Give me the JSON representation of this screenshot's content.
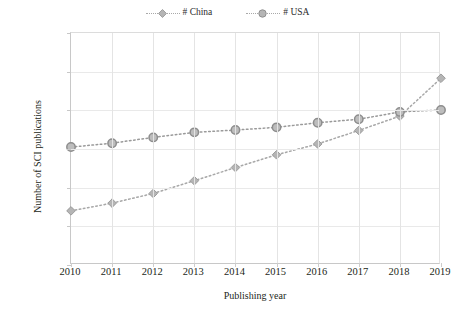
{
  "chart_data": {
    "type": "line",
    "title": "",
    "xlabel": "Publishing year",
    "ylabel": "Number of SCI publications",
    "x": [
      2010,
      2011,
      2012,
      2013,
      2014,
      2015,
      2016,
      2017,
      2018,
      2019
    ],
    "categories": [
      "2010",
      "2011",
      "2012",
      "2013",
      "2014",
      "2015",
      "2016",
      "2017",
      "2018",
      "2019"
    ],
    "xlim": [
      2010,
      2019
    ],
    "ylim": [
      0,
      600000
    ],
    "ytick_labels": [
      "0",
      "100000",
      "200000",
      "300000",
      "400000",
      "500000",
      "600000"
    ],
    "ytick_values": [
      0,
      100000,
      200000,
      300000,
      400000,
      500000,
      600000
    ],
    "grid": true,
    "legend_position": "top-center",
    "series": [
      {
        "name": "# China",
        "marker": "diamond",
        "color": "#a8a8a8",
        "linestyle": "dotted",
        "values": [
          140000,
          160000,
          185000,
          218000,
          252000,
          285000,
          313000,
          348000,
          385000,
          483000
        ]
      },
      {
        "name": "# USA",
        "marker": "circle",
        "color": "#9a9a9a",
        "linestyle": "dotted",
        "values": [
          305000,
          315000,
          330000,
          343000,
          349000,
          356000,
          368000,
          377000,
          396000,
          401000
        ]
      }
    ]
  },
  "legend": {
    "entries": [
      {
        "label": "# China",
        "marker": "diamond-marker-icon"
      },
      {
        "label": "# USA",
        "marker": "circle-marker-icon"
      }
    ]
  },
  "axes": {
    "y_title": "Number of SCI publications",
    "x_title": "Publishing year"
  },
  "colors": {
    "series_gray": "#a8a8a8",
    "marker_fill": "#b5b5b5",
    "marker_stroke": "#8f8f8f",
    "gridline": "#e9e9e9",
    "axis": "#c8c8c8",
    "text": "#231f20",
    "background": "#ffffff"
  }
}
